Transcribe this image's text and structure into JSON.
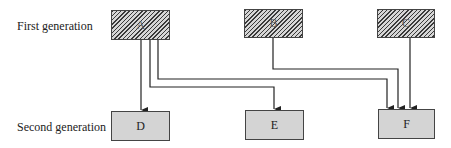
{
  "diagram": {
    "type": "generation-tree",
    "rows": [
      {
        "id": "row1",
        "label": "First generation"
      },
      {
        "id": "row2",
        "label": "Second generation"
      }
    ],
    "nodes": [
      {
        "id": "A",
        "label": "A",
        "generation": 1
      },
      {
        "id": "B",
        "label": "B",
        "generation": 1
      },
      {
        "id": "C",
        "label": "C",
        "generation": 1
      },
      {
        "id": "D",
        "label": "D",
        "generation": 2
      },
      {
        "id": "E",
        "label": "E",
        "generation": 2
      },
      {
        "id": "F",
        "label": "F",
        "generation": 2
      }
    ],
    "edges": [
      {
        "from": "A",
        "to": "D"
      },
      {
        "from": "A",
        "to": "E"
      },
      {
        "from": "A",
        "to": "F"
      },
      {
        "from": "B",
        "to": "F"
      },
      {
        "from": "C",
        "to": "F"
      }
    ],
    "colors": {
      "line": "#222222",
      "first_gen_fill": "hatched-gray",
      "second_gen_fill": "#d4d4d4"
    }
  }
}
